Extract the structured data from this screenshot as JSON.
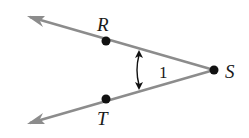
{
  "diagram": {
    "type": "angle",
    "vertex": {
      "label": "S",
      "x": 214,
      "y": 70
    },
    "rays": [
      {
        "name": "ray-SR",
        "point": {
          "label": "R",
          "x": 106,
          "y": 41
        },
        "arrow_tip": {
          "x": 27,
          "y": 16
        }
      },
      {
        "name": "ray-ST",
        "point": {
          "label": "T",
          "x": 106,
          "y": 99
        },
        "arrow_tip": {
          "x": 27,
          "y": 124
        }
      }
    ],
    "angle_label": "1",
    "labels": {
      "R": "R",
      "S": "S",
      "T": "T",
      "angle": "1"
    },
    "colors": {
      "ray": "#8c8c8c",
      "point": "#111111",
      "text": "#1a1a1a",
      "arc": "#111111"
    }
  }
}
